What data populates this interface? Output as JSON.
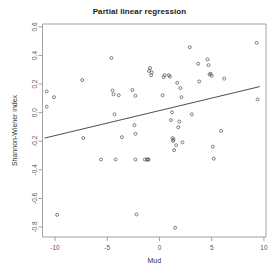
{
  "chart_data": {
    "type": "scatter",
    "title": "Partial linear regression",
    "xlabel": "Mud",
    "ylabel": "Shannon-Wiener index",
    "xlim": [
      -11.2,
      10.2
    ],
    "ylim": [
      -0.87,
      0.62
    ],
    "grid": false,
    "legend": null,
    "xticks": [
      -10,
      -5,
      0,
      5,
      10
    ],
    "xtick_labels": [
      "-10",
      "-5",
      "0",
      "5",
      "10"
    ],
    "yticks": [
      0.6,
      0.4,
      0.2,
      0.0,
      -0.2,
      -0.4,
      -0.6,
      -0.8
    ],
    "ytick_labels": [
      "0.6",
      "0.4",
      "0.2",
      "0.0",
      "-0.2",
      "-0.4",
      "-0.6",
      "-0.8"
    ],
    "point_marker": "open-circle",
    "point_color": "#4d4d4d",
    "line_color": "#3a3a3a",
    "regression_line": {
      "x_start": -11.0,
      "y_start": -0.178,
      "x_end": 9.6,
      "y_end": 0.182
    },
    "points": [
      {
        "x": -10.8,
        "y": 0.148
      },
      {
        "x": -10.8,
        "y": 0.042
      },
      {
        "x": -10.1,
        "y": 0.108
      },
      {
        "x": -9.8,
        "y": -0.715
      },
      {
        "x": -7.4,
        "y": 0.228
      },
      {
        "x": -7.3,
        "y": -0.178
      },
      {
        "x": -5.6,
        "y": -0.328
      },
      {
        "x": -4.6,
        "y": 0.382
      },
      {
        "x": -4.5,
        "y": 0.155
      },
      {
        "x": -4.4,
        "y": 0.128
      },
      {
        "x": -4.3,
        "y": -0.012
      },
      {
        "x": -4.2,
        "y": -0.328
      },
      {
        "x": -3.9,
        "y": 0.122
      },
      {
        "x": -3.6,
        "y": -0.172
      },
      {
        "x": -2.6,
        "y": 0.158
      },
      {
        "x": -2.4,
        "y": -0.088
      },
      {
        "x": -2.3,
        "y": 0.118
      },
      {
        "x": -2.3,
        "y": -0.148
      },
      {
        "x": -2.3,
        "y": -0.328
      },
      {
        "x": -2.2,
        "y": -0.712
      },
      {
        "x": -1.4,
        "y": -0.328
      },
      {
        "x": -1.2,
        "y": -0.328
      },
      {
        "x": -1.1,
        "y": -0.328
      },
      {
        "x": -1.05,
        "y": -0.328
      },
      {
        "x": -1.0,
        "y": 0.292
      },
      {
        "x": -0.9,
        "y": 0.312
      },
      {
        "x": -0.8,
        "y": 0.262
      },
      {
        "x": -0.75,
        "y": 0.282
      },
      {
        "x": 0.3,
        "y": 0.122
      },
      {
        "x": 0.4,
        "y": 0.248
      },
      {
        "x": 0.5,
        "y": 0.262
      },
      {
        "x": 0.9,
        "y": 0.262
      },
      {
        "x": 1.0,
        "y": 0.252
      },
      {
        "x": 1.1,
        "y": -0.052
      },
      {
        "x": 1.2,
        "y": 0.002
      },
      {
        "x": 1.25,
        "y": -0.178
      },
      {
        "x": 1.3,
        "y": -0.198
      },
      {
        "x": 1.35,
        "y": -0.188
      },
      {
        "x": 1.4,
        "y": -0.262
      },
      {
        "x": 1.5,
        "y": -0.805
      },
      {
        "x": 1.6,
        "y": -0.228
      },
      {
        "x": 1.7,
        "y": 0.208
      },
      {
        "x": 1.8,
        "y": -0.102
      },
      {
        "x": 1.9,
        "y": -0.062
      },
      {
        "x": 2.0,
        "y": 0.172
      },
      {
        "x": 2.1,
        "y": 0.108
      },
      {
        "x": 2.2,
        "y": -0.208
      },
      {
        "x": 2.9,
        "y": 0.458
      },
      {
        "x": 3.1,
        "y": -0.012
      },
      {
        "x": 3.7,
        "y": 0.342
      },
      {
        "x": 3.8,
        "y": 0.218
      },
      {
        "x": 4.6,
        "y": 0.372
      },
      {
        "x": 4.7,
        "y": 0.332
      },
      {
        "x": 4.8,
        "y": 0.268
      },
      {
        "x": 4.9,
        "y": 0.272
      },
      {
        "x": 5.0,
        "y": 0.258
      },
      {
        "x": 5.1,
        "y": -0.238
      },
      {
        "x": 5.2,
        "y": -0.322
      },
      {
        "x": 5.9,
        "y": -0.128
      },
      {
        "x": 6.2,
        "y": 0.238
      },
      {
        "x": 9.3,
        "y": 0.488
      },
      {
        "x": 9.4,
        "y": 0.092
      }
    ]
  }
}
